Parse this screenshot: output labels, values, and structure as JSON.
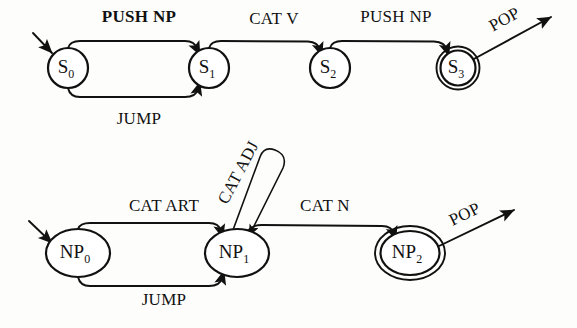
{
  "diagram": {
    "background_color": "#fdfdfb",
    "ink_color": "#111111",
    "networks": [
      {
        "id": "sentence-network",
        "name": "S network",
        "states": [
          {
            "id": "S0",
            "base": "S",
            "sub": "0",
            "kind": "start",
            "cx": 68,
            "cy": 68,
            "r": 20
          },
          {
            "id": "S1",
            "base": "S",
            "sub": "1",
            "kind": "normal",
            "cx": 209,
            "cy": 68,
            "r": 20
          },
          {
            "id": "S2",
            "base": "S",
            "sub": "2",
            "kind": "normal",
            "cx": 330,
            "cy": 68,
            "r": 20
          },
          {
            "id": "S3",
            "base": "S",
            "sub": "3",
            "kind": "final",
            "cx": 458,
            "cy": 68,
            "r": 20
          }
        ],
        "arcs": [
          {
            "id": "s0-s1-push",
            "label": "PUSH NP",
            "bold": true,
            "from": "S0",
            "to": "S1",
            "label_x": 139,
            "label_y": 22
          },
          {
            "id": "s0-s1-jump",
            "label": "JUMP",
            "bold": false,
            "from": "S0",
            "to": "S1",
            "label_x": 139,
            "label_y": 124
          },
          {
            "id": "s1-s2-cat",
            "label": "CAT V",
            "bold": false,
            "from": "S1",
            "to": "S2",
            "label_x": 274,
            "label_y": 24
          },
          {
            "id": "s2-s3-push",
            "label": "PUSH NP",
            "bold": false,
            "from": "S2",
            "to": "S3",
            "label_x": 396,
            "label_y": 22
          },
          {
            "id": "s3-pop",
            "label": "POP",
            "bold": false,
            "from": "S3",
            "to": null,
            "label_x": 507,
            "label_y": 24
          }
        ]
      },
      {
        "id": "np-network",
        "name": "NP network",
        "states": [
          {
            "id": "NP0",
            "base": "NP",
            "sub": "0",
            "kind": "start",
            "cx": 78,
            "cy": 253,
            "rx": 32,
            "ry": 24
          },
          {
            "id": "NP1",
            "base": "NP",
            "sub": "1",
            "kind": "normal",
            "cx": 237,
            "cy": 253,
            "rx": 32,
            "ry": 24
          },
          {
            "id": "NP2",
            "base": "NP",
            "sub": "2",
            "kind": "final",
            "cx": 410,
            "cy": 253,
            "rx": 32,
            "ry": 24
          }
        ],
        "arcs": [
          {
            "id": "np0-np1-art",
            "label": "CAT ART",
            "bold": false,
            "from": "NP0",
            "to": "NP1",
            "label_x": 164,
            "label_y": 211
          },
          {
            "id": "np0-np1-jump",
            "label": "JUMP",
            "bold": false,
            "from": "NP0",
            "to": "NP1",
            "label_x": 164,
            "label_y": 305
          },
          {
            "id": "np1-self-adj",
            "label": "CAT ADJ",
            "bold": false,
            "from": "NP1",
            "to": "NP1",
            "label_x": 243,
            "label_y": 175,
            "rotation": -62
          },
          {
            "id": "np1-np2-n",
            "label": "CAT N",
            "bold": false,
            "from": "NP1",
            "to": "NP2",
            "label_x": 325,
            "label_y": 211
          },
          {
            "id": "np2-pop",
            "label": "POP",
            "bold": false,
            "from": "NP2",
            "to": null,
            "label_x": 467,
            "label_y": 219
          }
        ]
      }
    ]
  }
}
